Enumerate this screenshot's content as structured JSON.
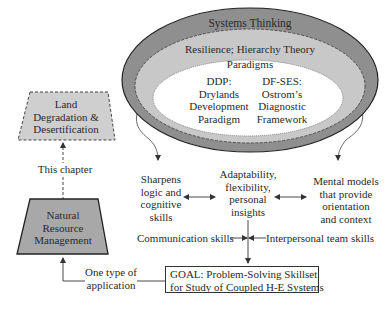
{
  "colors": {
    "outer_ring": "#8f8f8f",
    "middle_ring": "#c8c8c8",
    "inner_core": "#ffffff",
    "trapezoid_fill_light": "#cfcfcf",
    "trapezoid_fill_dark": "#a8a8a8",
    "stroke": "#333333"
  },
  "ellipse": {
    "outer_label": "Systems Thinking",
    "middle_label": "Resilience; Hierarchy Theory",
    "paradigms_label": "Paradigms",
    "ddp": {
      "line1": "DDP:",
      "line2": "Drylands",
      "line3": "Development",
      "line4": "Paradigm"
    },
    "dfses": {
      "line1": "DF-SES:",
      "line2": "Ostrom’s",
      "line3": "Diagnostic",
      "line4": "Framework"
    }
  },
  "left_column": {
    "land_box": {
      "line1": "Land",
      "line2": "Degradation &",
      "line3": "Desertification"
    },
    "this_chapter": "This chapter",
    "nrm_box": {
      "line1": "Natural",
      "line2": "Resource",
      "line3": "Management"
    },
    "application": {
      "line1": "One type of",
      "line2": "application"
    }
  },
  "skills": {
    "sharpens": {
      "line1": "Sharpens",
      "line2": "logic and",
      "line3": "cognitive",
      "line4": "skills"
    },
    "adaptability": {
      "line1": "Adaptability,",
      "line2": "flexibility,",
      "line3": "personal",
      "line4": "insights"
    },
    "mental": {
      "line1": "Mental models",
      "line2": "that provide",
      "line3": "orientation",
      "line4": "and context"
    },
    "communication": "Communication skills",
    "interpersonal": "Interpersonal team skills"
  },
  "goal": {
    "line1": "GOAL: Problem-Solving Skillset",
    "line2": "for Study of Coupled H-E Systems"
  }
}
